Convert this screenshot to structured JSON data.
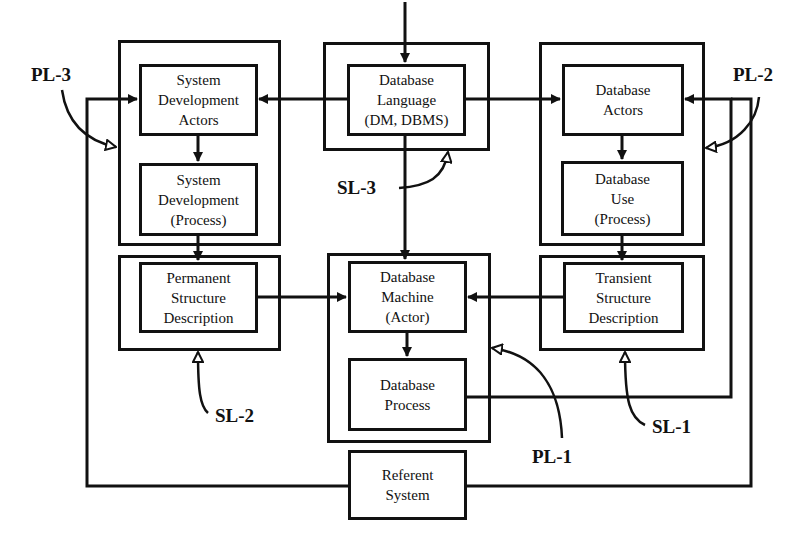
{
  "diagram": {
    "nodes": {
      "sysdev_actors": {
        "lines": [
          "System",
          "Development",
          "Actors"
        ]
      },
      "sysdev_process": {
        "lines": [
          "System",
          "Development",
          "(Process)"
        ]
      },
      "permanent": {
        "lines": [
          "Permanent",
          "Structure",
          "Description"
        ]
      },
      "db_language": {
        "lines": [
          "Database",
          "Language",
          "(DM, DBMS)"
        ]
      },
      "db_machine": {
        "lines": [
          "Database",
          "Machine",
          "(Actor)"
        ]
      },
      "db_process": {
        "lines": [
          "Database",
          "Process"
        ]
      },
      "referent": {
        "lines": [
          "Referent",
          "System"
        ]
      },
      "db_actors": {
        "lines": [
          "Database",
          "Actors"
        ]
      },
      "db_use": {
        "lines": [
          "Database",
          "Use",
          "(Process)"
        ]
      },
      "transient": {
        "lines": [
          "Transient",
          "Structure",
          "Description"
        ]
      }
    },
    "labels": {
      "pl3": "PL-3",
      "pl2": "PL-2",
      "pl1": "PL-1",
      "sl3": "SL-3",
      "sl2": "SL-2",
      "sl1": "SL-1"
    },
    "colors": {
      "stroke": "#111111",
      "background": "#ffffff"
    }
  }
}
